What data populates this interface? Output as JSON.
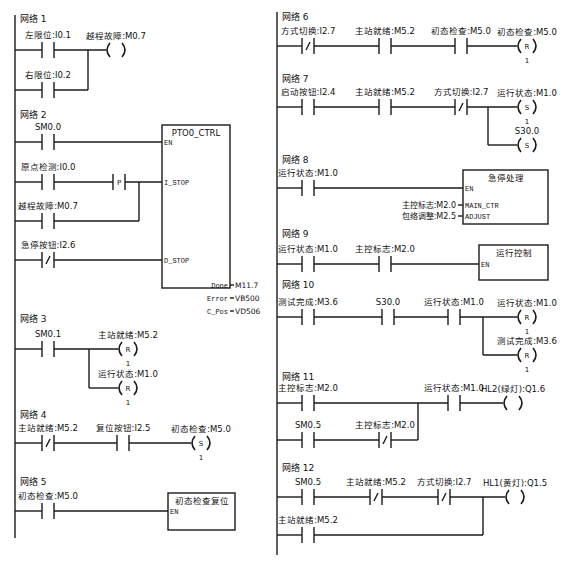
{
  "colors": {
    "line": "#1a1a1a",
    "text": "#111111",
    "background": "#ffffff"
  },
  "left_column": {
    "rail_x": 15,
    "rail_top": 15,
    "rail_bottom": 538,
    "networks": [
      {
        "title": "网络 1",
        "title_pos": [
          20,
          22
        ],
        "rungs": [
          {
            "y": 50,
            "x_end": 88,
            "elements": [
              {
                "type": "contact_no",
                "x": 42,
                "label": "左限位:I0.1"
              },
              {
                "type": "coil",
                "x": 113,
                "label": "越程故障:M0.7",
                "kind": ""
              }
            ]
          },
          {
            "y": 90,
            "x_end": 88,
            "join_x": 88,
            "join_to_y": 50,
            "elements": [
              {
                "type": "contact_no",
                "x": 42,
                "label": "右限位:I0.2"
              }
            ]
          }
        ]
      },
      {
        "title": "网络 2",
        "title_pos": [
          20,
          118
        ],
        "box": {
          "x": 162,
          "y": 125,
          "w": 68,
          "h": 163,
          "title": "PTO0_CTRL",
          "inputs": [
            {
              "name": "EN",
              "y": 142
            },
            {
              "name": "I_STOP",
              "y": 182
            },
            {
              "name": "D_STOP",
              "y": 260
            }
          ],
          "outputs": [
            {
              "name": "Done",
              "value": "M11.7",
              "y": 285
            },
            {
              "name": "Error",
              "value": "VB500",
              "y": 298
            },
            {
              "name": "C_Pos",
              "value": "VD506",
              "y": 311
            }
          ]
        },
        "rungs": [
          {
            "y": 142,
            "elements": [
              {
                "type": "contact_no",
                "x": 42,
                "label": "SM0.0"
              }
            ]
          },
          {
            "y": 182,
            "elements": [
              {
                "type": "contact_no",
                "x": 42,
                "label": "原点检测:I0.0"
              },
              {
                "type": "contact_p",
                "x": 113,
                "label": "P"
              }
            ]
          },
          {
            "y": 221,
            "join_x": 139,
            "join_to_y": 182,
            "elements": [
              {
                "type": "contact_no",
                "x": 42,
                "label": "越程故障:M0.7"
              }
            ]
          },
          {
            "y": 260,
            "elements": [
              {
                "type": "contact_nc",
                "x": 42,
                "label": "急停按钮:I2.6"
              }
            ]
          }
        ]
      },
      {
        "title": "网络 3",
        "title_pos": [
          20,
          322
        ],
        "rungs": [
          {
            "y": 349,
            "elements": [
              {
                "type": "contact_no",
                "x": 42,
                "label": "SM0.1"
              },
              {
                "type": "coil",
                "x": 125,
                "label": "主站就绪:M5.2",
                "kind": "R",
                "count": "1"
              }
            ]
          },
          {
            "y": 388,
            "join_x": 89,
            "join_to_y": 349,
            "elements": [
              {
                "type": "coil",
                "x": 125,
                "label": "运行状态:M1.0",
                "kind": "R",
                "count": "1"
              }
            ]
          }
        ]
      },
      {
        "title": "网络 4",
        "title_pos": [
          20,
          418
        ],
        "rungs": [
          {
            "y": 443,
            "elements": [
              {
                "type": "contact_nc",
                "x": 42,
                "label": "主站就绪:M5.2"
              },
              {
                "type": "contact_no",
                "x": 117,
                "label": "复位按钮:I2.5"
              },
              {
                "type": "coil",
                "x": 198,
                "label": "初态检查:M5.0",
                "kind": "S",
                "count": "1"
              }
            ]
          }
        ]
      },
      {
        "title": "网络 5",
        "title_pos": [
          20,
          485
        ],
        "box": {
          "x": 168,
          "y": 493,
          "w": 67,
          "h": 37,
          "title": "初态检查复位",
          "inputs": [
            {
              "name": "EN",
              "y": 511
            }
          ],
          "outputs": []
        },
        "rungs": [
          {
            "y": 511,
            "elements": [
              {
                "type": "contact_no",
                "x": 42,
                "label": "初态检查:M5.0"
              }
            ]
          }
        ]
      }
    ]
  },
  "right_column": {
    "rail_x": 277,
    "rail_top": 12,
    "rail_bottom": 555,
    "networks": [
      {
        "title": "网络 6",
        "title_pos": [
          282,
          20
        ],
        "rungs": [
          {
            "y": 46,
            "elements": [
              {
                "type": "contact_nc",
                "x": 302,
                "label": "方式切换:I2.7"
              },
              {
                "type": "contact_no",
                "x": 379,
                "label": "主站就绪:M5.2"
              },
              {
                "type": "contact_no",
                "x": 455,
                "label": "初态检查:M5.0"
              },
              {
                "type": "coil",
                "x": 524,
                "label": "初态检查:M5.0",
                "kind": "R",
                "count": "1"
              }
            ]
          }
        ]
      },
      {
        "title": "网络 7",
        "title_pos": [
          282,
          82
        ],
        "rungs": [
          {
            "y": 107,
            "elements": [
              {
                "type": "contact_no",
                "x": 302,
                "label": "启动按钮:I2.4"
              },
              {
                "type": "contact_no",
                "x": 379,
                "label": "主站就绪:M5.2"
              },
              {
                "type": "contact_nc",
                "x": 455,
                "label": "方式切换:I2.7"
              },
              {
                "type": "coil",
                "x": 524,
                "label": "运行状态:M1.0",
                "kind": "S",
                "count": "1"
              }
            ]
          },
          {
            "y": 145,
            "join_x": 488,
            "join_to_y": 107,
            "elements": [
              {
                "type": "coil",
                "x": 524,
                "label": "S30.0",
                "kind": "S"
              }
            ]
          }
        ]
      },
      {
        "title": "网络 8",
        "title_pos": [
          282,
          163
        ],
        "box": {
          "x": 463,
          "y": 170,
          "w": 85,
          "h": 54,
          "title": "急停处理",
          "inputs": [
            {
              "name": "EN",
              "y": 188
            },
            {
              "name": "MAIN_CTR",
              "y": 205,
              "param": "主控标志:M2.0"
            },
            {
              "name": "ADJUST",
              "y": 216,
              "param": "包络调整:M2.5"
            }
          ],
          "outputs": []
        },
        "rungs": [
          {
            "y": 188,
            "elements": [
              {
                "type": "contact_no",
                "x": 302,
                "label": "运行状态:M1.0"
              }
            ]
          }
        ]
      },
      {
        "title": "网络 9",
        "title_pos": [
          282,
          237
        ],
        "box": {
          "x": 479,
          "y": 245,
          "w": 69,
          "h": 35,
          "title": "运行控制",
          "inputs": [
            {
              "name": "EN",
              "y": 264
            }
          ],
          "outputs": []
        },
        "rungs": [
          {
            "y": 264,
            "elements": [
              {
                "type": "contact_no",
                "x": 302,
                "label": "运行状态:M1.0"
              },
              {
                "type": "contact_no",
                "x": 379,
                "label": "主控标志:M2.0"
              }
            ]
          }
        ]
      },
      {
        "title": "网络 10",
        "title_pos": [
          282,
          288
        ],
        "rungs": [
          {
            "y": 317,
            "elements": [
              {
                "type": "contact_no",
                "x": 302,
                "label": "测试完成:M3.6"
              },
              {
                "type": "contact_no",
                "x": 382,
                "label": "S30.0"
              },
              {
                "type": "contact_no",
                "x": 448,
                "label": "运行状态:M1.0"
              },
              {
                "type": "coil",
                "x": 524,
                "label": "运行状态:M1.0",
                "kind": "R",
                "count": "1"
              }
            ]
          },
          {
            "y": 355,
            "join_x": 483,
            "join_to_y": 317,
            "elements": [
              {
                "type": "coil",
                "x": 524,
                "label": "测试完成:M3.6",
                "kind": "R",
                "count": "1"
              }
            ]
          }
        ]
      },
      {
        "title": "网络 11",
        "title_pos": [
          282,
          380
        ],
        "rungs": [
          {
            "y": 403,
            "elements": [
              {
                "type": "contact_no",
                "x": 302,
                "label": "主控标志:M2.0"
              },
              {
                "type": "contact_no",
                "x": 448,
                "label": "运行状态:M1.0"
              },
              {
                "type": "coil",
                "x": 510,
                "label": "HL2(绿灯):Q1.6",
                "kind": ""
              }
            ]
          },
          {
            "y": 440,
            "join_x": 418,
            "join_to_y": 403,
            "elements": [
              {
                "type": "contact_no",
                "x": 302,
                "label": "SM0.5"
              },
              {
                "type": "contact_nc",
                "x": 379,
                "label": "主控标志:M2.0"
              }
            ]
          }
        ]
      },
      {
        "title": "网络 12",
        "title_pos": [
          282,
          471
        ],
        "rungs": [
          {
            "y": 497,
            "elements": [
              {
                "type": "contact_no",
                "x": 302,
                "label": "SM0.5"
              },
              {
                "type": "contact_nc",
                "x": 370,
                "label": "主站就绪:M5.2"
              },
              {
                "type": "contact_nc",
                "x": 438,
                "label": "方式切换:I2.7"
              },
              {
                "type": "coil",
                "x": 512,
                "label": "HL1(黄灯):Q1.5",
                "kind": ""
              }
            ]
          },
          {
            "y": 535,
            "join_x": 483,
            "join_to_y": 497,
            "elements": [
              {
                "type": "contact_no",
                "x": 302,
                "label": "主站就绪:M5.2"
              }
            ]
          }
        ]
      }
    ]
  }
}
